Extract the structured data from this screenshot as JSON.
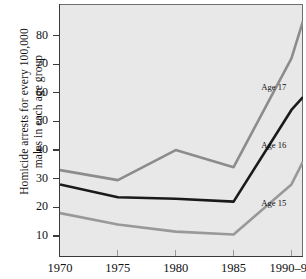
{
  "chart_data": {
    "type": "line",
    "title": "",
    "xlabel": "",
    "ylabel": "Homicide arrests for every 100,000\nmales in each age group",
    "x": [
      1970,
      1975,
      1980,
      1985,
      1990,
      1991
    ],
    "xtick_labels": [
      "1970",
      "1975",
      "1980",
      "1985",
      "1990–91"
    ],
    "xtick_values": [
      1970,
      1975,
      1980,
      1985,
      1990
    ],
    "ytick_labels": [
      "10",
      "20",
      "30",
      "40",
      "50",
      "60",
      "70",
      "80"
    ],
    "ytick_values": [
      10,
      20,
      30,
      40,
      50,
      60,
      70,
      80
    ],
    "xlim": [
      1970,
      1991
    ],
    "ylim": [
      3,
      91
    ],
    "grid": false,
    "legend_position": "inline-right",
    "plot_background": "#e8e8e8",
    "series": [
      {
        "name": "Age 17",
        "label": "Age 17",
        "color": "#8c8c8c",
        "width": 2.6,
        "values": [
          33,
          29.5,
          40,
          34,
          72,
          85
        ],
        "label_x": 1987.4,
        "label_y": 61.5
      },
      {
        "name": "Age 16",
        "label": "Age 16",
        "color": "#1a1a1a",
        "width": 2.6,
        "values": [
          28,
          23.5,
          23,
          22,
          54,
          58.5
        ],
        "label_x": 1987.4,
        "label_y": 41.5
      },
      {
        "name": "Age 15",
        "label": "Age 15",
        "color": "#999999",
        "width": 2.6,
        "values": [
          18,
          14,
          11.5,
          10.5,
          28,
          36
        ],
        "label_x": 1987.4,
        "label_y": 21.0
      }
    ]
  }
}
